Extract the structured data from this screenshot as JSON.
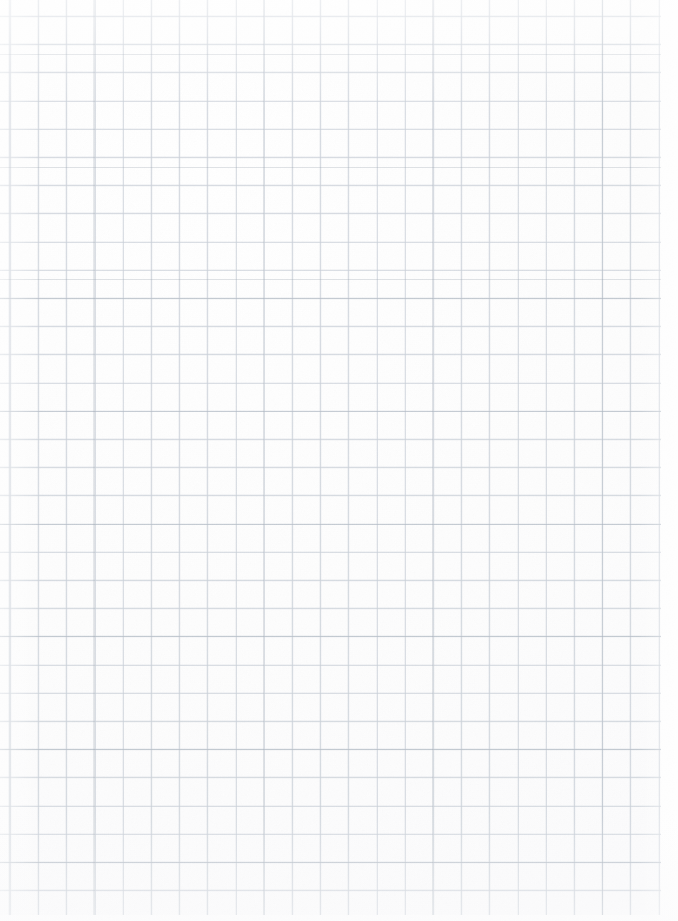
{
  "document": {
    "kind": "graph-paper-sheet",
    "description": "Blank sheet of square-ruled graph paper (quadrille paper). No text, marks, drawings, or user interface elements are present anywhere on the sheet.",
    "orientation": "portrait",
    "width_px": 678,
    "height_px": 921,
    "has_text": false,
    "has_drawn_marks": false,
    "has_ui_chrome": false
  },
  "grid": {
    "style": "square-ruled",
    "cell_size_px": 28.2,
    "first_vertical_line_x_px": 10,
    "first_horizontal_line_y_px": 16,
    "column_count": 24,
    "row_count": 33,
    "line_width_px": 1,
    "right_margin_px": 17,
    "bottom_margin_px": 6
  },
  "colors": {
    "paper": "#fefefe",
    "paper_tint": "#fbfbfc",
    "grid_line": "#c4cbd4",
    "grid_line_soft": "#cdd3db",
    "grid_line_emphasis": "#96a0ac"
  },
  "artifacts": {
    "description": "Scan artifacts only: faint paper grain, slight vignetting at the edges, and irregular darkening of some rules. None of these constitute content.",
    "grain_opacity": 0.5,
    "vignette": true,
    "uneven_rule_darkness": true
  }
}
